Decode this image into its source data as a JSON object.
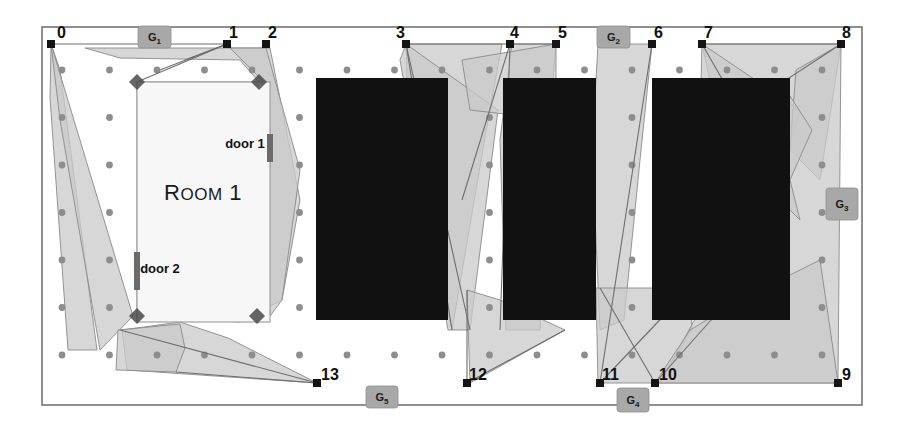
{
  "figure": {
    "kind": "floorplan-diagram",
    "background_color": "#ffffff",
    "border_color": "#555555",
    "canvas": {
      "x": 42,
      "y": 27,
      "width": 820,
      "height": 378
    }
  },
  "colors": {
    "obstacle_fill": "#111111",
    "visibility_fill": "#c9c9c9",
    "visibility_stroke": "#8a8a8a",
    "room_fill": "#f7f7f7",
    "room_stroke": "#9a9a9a",
    "gate_fill": "#a8a8a8",
    "gate_stroke": "#8f8f8f",
    "vertex_fill": "#141414",
    "guard_fill": "#4a4a4a",
    "grid_dot_fill": "#8d8d8d"
  },
  "room": {
    "label": "Room 1",
    "rect": {
      "x": 137,
      "y": 82,
      "width": 133,
      "height": 240
    },
    "label_x": 203,
    "label_y": 200,
    "doors": [
      {
        "label": "door 1",
        "label_x": 245,
        "label_y": 148,
        "mark_x": 267,
        "mark_y": 134,
        "mark_w": 6,
        "mark_h": 28
      },
      {
        "label": "door 2",
        "label_x": 160,
        "label_y": 273,
        "mark_x": 134,
        "mark_y": 252,
        "mark_w": 6,
        "mark_h": 38
      }
    ],
    "corner_guards": [
      {
        "x": 137,
        "y": 82
      },
      {
        "x": 259,
        "y": 82
      },
      {
        "x": 137,
        "y": 316
      },
      {
        "x": 257,
        "y": 316
      }
    ]
  },
  "vertices": [
    {
      "id": "0",
      "x": 51,
      "y": 44,
      "label_dx": 6,
      "label_dy": -6
    },
    {
      "id": "1",
      "x": 227,
      "y": 44,
      "label_dx": 2,
      "label_dy": -6
    },
    {
      "id": "2",
      "x": 266,
      "y": 44,
      "label_dx": 2,
      "label_dy": -6
    },
    {
      "id": "3",
      "x": 406,
      "y": 44,
      "label_dx": -1,
      "label_dy": -6
    },
    {
      "id": "4",
      "x": 510,
      "y": 44,
      "label_dx": 0,
      "label_dy": -6
    },
    {
      "id": "5",
      "x": 556,
      "y": 44,
      "label_dx": 2,
      "label_dy": -6
    },
    {
      "id": "6",
      "x": 652,
      "y": 44,
      "label_dx": 2,
      "label_dy": -6
    },
    {
      "id": "7",
      "x": 702,
      "y": 44,
      "label_dx": 2,
      "label_dy": -6
    },
    {
      "id": "8",
      "x": 841,
      "y": 44,
      "label_dx": 1,
      "label_dy": -6
    },
    {
      "id": "9",
      "x": 838,
      "y": 383,
      "label_dx": 4,
      "label_dy": -3
    },
    {
      "id": "10",
      "x": 655,
      "y": 383,
      "label_dx": 4,
      "label_dy": -3
    },
    {
      "id": "11",
      "x": 600,
      "y": 383,
      "label_dx": 2,
      "label_dy": -3
    },
    {
      "id": "12",
      "x": 467,
      "y": 383,
      "label_dx": 2,
      "label_dy": -3
    },
    {
      "id": "13",
      "x": 317,
      "y": 383,
      "label_dx": 4,
      "label_dy": -3
    }
  ],
  "gates": [
    {
      "id": "G1",
      "letter": "G",
      "sub": "1",
      "x": 138,
      "y": 26,
      "width": 33,
      "height": 22,
      "orientation": "top"
    },
    {
      "id": "G2",
      "letter": "G",
      "sub": "2",
      "x": 597,
      "y": 26,
      "width": 33,
      "height": 22,
      "orientation": "top"
    },
    {
      "id": "G3",
      "letter": "G",
      "sub": "3",
      "x": 826,
      "y": 188,
      "width": 32,
      "height": 32,
      "orientation": "right"
    },
    {
      "id": "G4",
      "letter": "G",
      "sub": "4",
      "x": 617,
      "y": 388,
      "width": 32,
      "height": 24,
      "orientation": "bottom"
    },
    {
      "id": "G5",
      "letter": "G",
      "sub": "5",
      "x": 366,
      "y": 386,
      "width": 32,
      "height": 22,
      "orientation": "bottom"
    }
  ],
  "obstacles": [
    {
      "name": "obstacle-a",
      "x": 316,
      "y": 78,
      "width": 132,
      "height": 242
    },
    {
      "name": "obstacle-b",
      "x": 503,
      "y": 78,
      "width": 93,
      "height": 242
    },
    {
      "name": "obstacle-c",
      "x": 652,
      "y": 78,
      "width": 138,
      "height": 242
    }
  ],
  "visibility_regions": [
    {
      "name": "vis-region-0-left",
      "points": "51,44 60,70 97,350 68,350 50,98"
    },
    {
      "name": "vis-region-0-wedge",
      "points": "51,44 133,316 100,350 60,120"
    },
    {
      "name": "vis-region-1-top",
      "points": "85,48 270,48 300,200 282,300 240,322 137,316 137,82 259,82 240,60 120,58"
    },
    {
      "name": "vis-region-2-band",
      "points": "266,48 300,170 282,300 270,316 262,80 230,48"
    },
    {
      "name": "vis-region-13-lower",
      "points": "122,330 180,322 228,338 317,383 127,370"
    },
    {
      "name": "vis-region-13-box",
      "points": "118,330 180,324 185,348 176,372 116,370"
    },
    {
      "name": "vis-region-3-fan",
      "points": "406,44 502,44 488,120 452,330 432,250 408,120"
    },
    {
      "name": "vis-region-3-narrow",
      "points": "406,44 498,110 470,330 448,330 400,60"
    },
    {
      "name": "vis-region-4-down",
      "points": "512,44 556,44 548,140 540,330 506,330 500,140"
    },
    {
      "name": "vis-region-12-tri",
      "points": "467,290 470,383 565,330 500,300"
    },
    {
      "name": "vis-region-4-5-top",
      "points": "462,60 556,44 556,120 470,110"
    },
    {
      "name": "vis-region-2-gate",
      "points": "598,44 652,44 640,160 624,320 600,330 592,150"
    },
    {
      "name": "vis-region-11-box",
      "points": "596,288 690,288 692,330 660,383 598,383"
    },
    {
      "name": "vis-region-7-8-fan",
      "points": "702,44 841,44 820,180 790,150 740,110 712,90"
    },
    {
      "name": "vis-region-7-left",
      "points": "702,44 800,110 760,250 700,120"
    },
    {
      "name": "vis-region-8-col",
      "points": "796,70 841,44 838,383 660,383 700,310 760,250 790,150"
    },
    {
      "name": "vis-region-9-lower",
      "points": "655,383 838,383 820,260 740,300 690,330"
    },
    {
      "name": "vis-region-8-zig",
      "points": "790,96 812,130 790,180 800,220 780,200 784,150"
    }
  ],
  "visibility_edges": [
    {
      "name": "edge-0-1",
      "x1": 51,
      "y1": 44,
      "x2": 227,
      "y2": 44
    },
    {
      "name": "edge-1-a",
      "x1": 227,
      "y1": 44,
      "x2": 137,
      "y2": 82
    },
    {
      "name": "edge-1-b",
      "x1": 227,
      "y1": 44,
      "x2": 160,
      "y2": 70
    },
    {
      "name": "edge-1-c",
      "x1": 227,
      "y1": 44,
      "x2": 185,
      "y2": 60
    },
    {
      "name": "edge-3-a",
      "x1": 406,
      "y1": 44,
      "x2": 452,
      "y2": 330
    },
    {
      "name": "edge-3-b",
      "x1": 406,
      "y1": 44,
      "x2": 470,
      "y2": 330
    },
    {
      "name": "edge-3-c",
      "x1": 406,
      "y1": 44,
      "x2": 510,
      "y2": 44
    },
    {
      "name": "edge-4-a",
      "x1": 510,
      "y1": 44,
      "x2": 462,
      "y2": 200
    },
    {
      "name": "edge-4-b",
      "x1": 510,
      "y1": 44,
      "x2": 556,
      "y2": 44
    },
    {
      "name": "edge-4-c",
      "x1": 510,
      "y1": 44,
      "x2": 500,
      "y2": 330
    },
    {
      "name": "edge-7-a",
      "x1": 702,
      "y1": 44,
      "x2": 780,
      "y2": 180
    },
    {
      "name": "edge-7-b",
      "x1": 702,
      "y1": 44,
      "x2": 841,
      "y2": 44
    },
    {
      "name": "edge-8-a",
      "x1": 841,
      "y1": 44,
      "x2": 740,
      "y2": 110
    },
    {
      "name": "edge-10-a",
      "x1": 655,
      "y1": 383,
      "x2": 600,
      "y2": 288
    },
    {
      "name": "edge-11-a",
      "x1": 600,
      "y1": 383,
      "x2": 690,
      "y2": 288
    },
    {
      "name": "edge-11-b",
      "x1": 600,
      "y1": 383,
      "x2": 652,
      "y2": 44
    },
    {
      "name": "edge-10-b",
      "x1": 655,
      "y1": 383,
      "x2": 720,
      "y2": 310
    },
    {
      "name": "edge-13-a",
      "x1": 317,
      "y1": 383,
      "x2": 120,
      "y2": 330
    },
    {
      "name": "edge-13-b",
      "x1": 317,
      "y1": 383,
      "x2": 176,
      "y2": 372
    },
    {
      "name": "edge-12-a",
      "x1": 467,
      "y1": 383,
      "x2": 565,
      "y2": 330
    },
    {
      "name": "edge-12-b",
      "x1": 467,
      "y1": 383,
      "x2": 467,
      "y2": 290
    }
  ],
  "grid": {
    "x_start": 62,
    "x_step": 47.5,
    "x_count": 17,
    "y_start": 70,
    "y_step": 47.5,
    "y_count": 7,
    "dot_radius": 3.4
  }
}
